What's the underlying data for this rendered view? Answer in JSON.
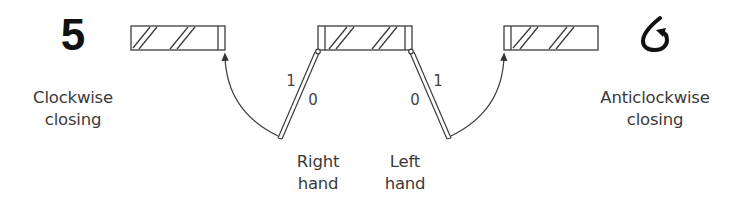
{
  "diagram": {
    "left_symbol": {
      "label": "5",
      "meaning": "clockwise-closing-symbol"
    },
    "right_symbol": {
      "label": "6",
      "meaning": "anticlockwise-closing-symbol"
    },
    "left_caption": {
      "line1": "Clockwise",
      "line2": "closing"
    },
    "right_caption": {
      "line1": "Anticlockwise",
      "line2": "closing"
    },
    "right_hand": {
      "line1": "Right",
      "line2": "hand",
      "face_outer": "1",
      "face_inner": "0"
    },
    "left_hand": {
      "line1": "Left",
      "line2": "hand",
      "face_inner": "0",
      "face_outer": "1"
    },
    "colors": {
      "stroke": "#3c3c3c",
      "text": "#3a3a3a",
      "symbol": "#111111"
    }
  }
}
